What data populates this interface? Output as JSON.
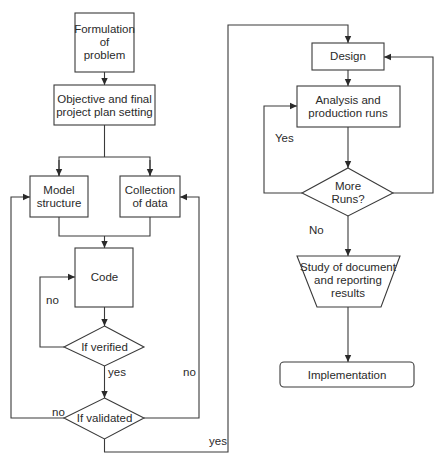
{
  "diagram": {
    "type": "flowchart",
    "nodes": {
      "formulation": {
        "shape": "rectangle",
        "lines": [
          "Formulation",
          "of",
          "problem"
        ]
      },
      "objective": {
        "shape": "rectangle",
        "lines": [
          "Objective and final",
          "project plan setting"
        ]
      },
      "model_structure": {
        "shape": "rectangle",
        "lines": [
          "Model",
          "structure"
        ]
      },
      "collection_data": {
        "shape": "rectangle",
        "lines": [
          "Collection",
          "of data"
        ]
      },
      "code": {
        "shape": "rectangle",
        "lines": [
          "Code"
        ]
      },
      "if_verified": {
        "shape": "diamond",
        "lines": [
          "If verified"
        ]
      },
      "if_validated": {
        "shape": "diamond",
        "lines": [
          "If validated"
        ]
      },
      "design": {
        "shape": "rectangle",
        "lines": [
          "Design"
        ]
      },
      "analysis": {
        "shape": "rectangle",
        "lines": [
          "Analysis and",
          "production runs"
        ]
      },
      "more_runs": {
        "shape": "diamond",
        "lines": [
          "More",
          "Runs?"
        ]
      },
      "study": {
        "shape": "trapezoid",
        "lines": [
          "Study of document",
          "and reporting",
          "results"
        ]
      },
      "implementation": {
        "shape": "rounded-rectangle",
        "lines": [
          "Implementation"
        ]
      }
    },
    "edge_labels": {
      "verified_no": "no",
      "verified_yes": "yes",
      "validated_no_left": "no",
      "validated_no_right": "no",
      "validated_yes": "yes",
      "more_runs_yes": "Yes",
      "more_runs_no": "No"
    },
    "edges": [
      {
        "from": "formulation",
        "to": "objective"
      },
      {
        "from": "objective",
        "to": "model_structure"
      },
      {
        "from": "objective",
        "to": "collection_data"
      },
      {
        "from": "model_structure",
        "to": "code"
      },
      {
        "from": "collection_data",
        "to": "code"
      },
      {
        "from": "code",
        "to": "if_verified"
      },
      {
        "from": "if_verified",
        "to": "code",
        "label": "no"
      },
      {
        "from": "if_verified",
        "to": "if_validated",
        "label": "yes"
      },
      {
        "from": "if_validated",
        "to": "model_structure",
        "label": "no"
      },
      {
        "from": "if_validated",
        "to": "collection_data",
        "label": "no"
      },
      {
        "from": "if_validated",
        "to": "design",
        "label": "yes"
      },
      {
        "from": "design",
        "to": "analysis"
      },
      {
        "from": "analysis",
        "to": "more_runs"
      },
      {
        "from": "more_runs",
        "to": "analysis",
        "label": "Yes"
      },
      {
        "from": "more_runs",
        "to": "design"
      },
      {
        "from": "more_runs",
        "to": "study",
        "label": "No"
      },
      {
        "from": "study",
        "to": "implementation"
      }
    ]
  }
}
